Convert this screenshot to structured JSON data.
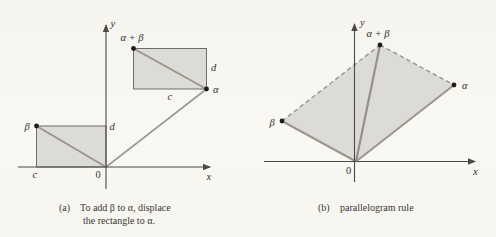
{
  "figure": {
    "colors": {
      "background": "#f7f5ef",
      "region_fill": "#dcdbd6",
      "vector_line": "#98968f",
      "axis_line": "#4c4a47",
      "rectangle_stroke": "#6e6c68",
      "point_dot": "#1e1c1a",
      "text": "#33302b"
    },
    "panel_a": {
      "labels": {
        "y_axis": "y",
        "x_axis": "x",
        "origin": "0",
        "beta": "β",
        "alpha": "α",
        "alpha_plus_beta": "α + β",
        "c_bottom": "c",
        "d_bottom": "d",
        "c_top": "c",
        "d_top": "d"
      },
      "caption": {
        "prefix": "(a)",
        "line1": "To add β to α, displace",
        "line2": "the rectangle to α."
      }
    },
    "panel_b": {
      "labels": {
        "y_axis": "y",
        "x_axis": "x",
        "origin": "0",
        "beta": "β",
        "alpha": "α",
        "alpha_plus_beta": "α + β"
      },
      "caption": {
        "prefix": "(b)",
        "text": "parallelogram rule"
      }
    }
  }
}
